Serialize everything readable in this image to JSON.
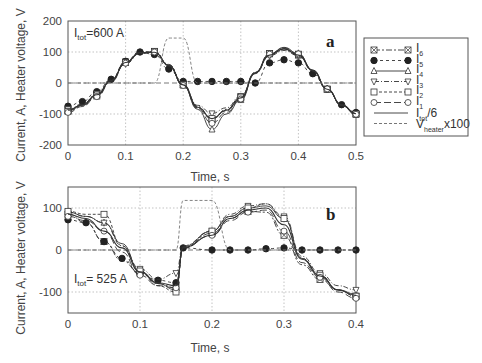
{
  "chart_data": [
    {
      "type": "line",
      "panel_label": "a",
      "annotation": "I_tot=600 A",
      "xlabel": "Time, s",
      "ylabel": "Current, A, Heater voltage, V",
      "xlim": [
        0,
        0.5
      ],
      "ylim": [
        -200,
        200
      ],
      "x_ticks": [
        "0",
        "0.1",
        "0.2",
        "0.3",
        "0.4",
        "0.5"
      ],
      "y_ticks": [
        "200",
        "100",
        "0",
        "-100",
        "-200"
      ],
      "grid": true,
      "x": [
        0,
        0.025,
        0.05,
        0.075,
        0.1,
        0.125,
        0.15,
        0.175,
        0.2,
        0.225,
        0.25,
        0.275,
        0.3,
        0.325,
        0.35,
        0.375,
        0.4,
        0.425,
        0.45,
        0.475,
        0.5
      ],
      "series": [
        {
          "name": "I6",
          "marker": "boxed-x",
          "values": [
            -88,
            -70,
            -38,
            10,
            68,
            100,
            102,
            60,
            -5,
            -75,
            -118,
            -85,
            -45,
            35,
            95,
            110,
            90,
            40,
            -20,
            -70,
            -100
          ]
        },
        {
          "name": "I5",
          "marker": "filled-circle",
          "values": [
            -75,
            -60,
            -28,
            12,
            70,
            100,
            92,
            45,
            5,
            5,
            5,
            5,
            5,
            0,
            65,
            75,
            65,
            30,
            -20,
            -70,
            -95
          ]
        },
        {
          "name": "I4",
          "marker": "triangle-up",
          "values": [
            -90,
            -72,
            -40,
            8,
            66,
            98,
            100,
            58,
            -8,
            -85,
            -150,
            -100,
            -55,
            32,
            92,
            115,
            95,
            42,
            -18,
            -72,
            -102
          ]
        },
        {
          "name": "I3",
          "marker": "triangle-down",
          "values": [
            -85,
            -68,
            -35,
            10,
            62,
            95,
            98,
            55,
            -5,
            -72,
            -98,
            -80,
            -42,
            30,
            88,
            105,
            88,
            38,
            -20,
            -70,
            -98
          ]
        },
        {
          "name": "I2",
          "marker": "square",
          "values": [
            -92,
            -74,
            -42,
            6,
            66,
            98,
            102,
            58,
            -6,
            -80,
            -115,
            -90,
            -48,
            34,
            95,
            112,
            93,
            40,
            -20,
            -72,
            -100
          ]
        },
        {
          "name": "I1",
          "marker": "circle",
          "values": [
            -95,
            -76,
            -44,
            4,
            64,
            96,
            100,
            56,
            -8,
            -82,
            -130,
            -95,
            -52,
            33,
            93,
            113,
            94,
            41,
            -19,
            -73,
            -101
          ]
        },
        {
          "name": "Itot/6",
          "marker": "none",
          "style": "solid",
          "values": [
            -88,
            -70,
            -38,
            8,
            66,
            98,
            99,
            56,
            -6,
            -78,
            -115,
            -88,
            -48,
            32,
            90,
            110,
            90,
            40,
            -20,
            -70,
            -99
          ]
        },
        {
          "name": "Vheater x100",
          "marker": "none",
          "style": "dashed",
          "values": [
            0,
            0,
            0,
            0,
            0,
            0,
            0,
            145,
            145,
            0,
            0,
            0,
            0,
            0,
            0,
            0,
            0,
            0,
            0,
            0,
            0
          ]
        }
      ]
    },
    {
      "type": "line",
      "panel_label": "b",
      "annotation": "I_tot= 525 A",
      "xlabel": "Time, s",
      "ylabel": "Current, A, Heater voltage, V",
      "xlim": [
        0,
        0.4
      ],
      "ylim": [
        -150,
        150
      ],
      "x_ticks": [
        "0",
        "0.1",
        "0.2",
        "0.3",
        "0.4"
      ],
      "y_ticks": [
        "100",
        "0",
        "-100"
      ],
      "grid": true,
      "x": [
        0,
        0.025,
        0.05,
        0.075,
        0.1,
        0.125,
        0.15,
        0.16,
        0.2,
        0.225,
        0.25,
        0.275,
        0.3,
        0.325,
        0.35,
        0.375,
        0.4
      ],
      "series": [
        {
          "name": "I6",
          "marker": "boxed-x",
          "values": [
            85,
            65,
            20,
            -25,
            -55,
            -80,
            -90,
            5,
            40,
            75,
            92,
            90,
            35,
            -35,
            -70,
            -95,
            -110
          ]
        },
        {
          "name": "I5",
          "marker": "filled-circle",
          "values": [
            72,
            65,
            20,
            -20,
            -55,
            -72,
            -78,
            5,
            0,
            0,
            0,
            3,
            5,
            0,
            0,
            0,
            0
          ]
        },
        {
          "name": "I4",
          "marker": "triangle-up",
          "values": [
            90,
            80,
            65,
            15,
            -50,
            -80,
            -95,
            8,
            45,
            80,
            100,
            105,
            75,
            -20,
            -60,
            -95,
            -105
          ]
        },
        {
          "name": "I3",
          "marker": "triangle-down",
          "values": [
            90,
            80,
            65,
            10,
            -45,
            -70,
            -55,
            10,
            45,
            85,
            105,
            110,
            80,
            -15,
            -55,
            -85,
            -95
          ]
        },
        {
          "name": "I2",
          "marker": "square",
          "values": [
            92,
            85,
            85,
            10,
            -50,
            -85,
            -100,
            5,
            45,
            80,
            100,
            110,
            75,
            -20,
            -60,
            -95,
            -110
          ]
        },
        {
          "name": "I1",
          "marker": "circle",
          "values": [
            80,
            70,
            45,
            -5,
            -60,
            -85,
            -90,
            5,
            35,
            70,
            90,
            95,
            45,
            -30,
            -65,
            -100,
            -115
          ]
        },
        {
          "name": "Itot/6",
          "marker": "none",
          "style": "solid",
          "values": [
            85,
            75,
            45,
            5,
            -52,
            -78,
            -85,
            6,
            35,
            75,
            95,
            100,
            60,
            -22,
            -62,
            -95,
            -108
          ]
        },
        {
          "name": "Vheater x100",
          "marker": "none",
          "style": "dashed",
          "values": [
            0,
            0,
            0,
            0,
            0,
            0,
            0,
            118,
            118,
            0,
            0,
            0,
            0,
            0,
            0,
            0,
            0
          ]
        }
      ]
    }
  ],
  "legend": {
    "entries": [
      {
        "label": "I",
        "sub": "6"
      },
      {
        "label": "I",
        "sub": "5"
      },
      {
        "label": "I",
        "sub": "4"
      },
      {
        "label": "I",
        "sub": "3"
      },
      {
        "label": "I",
        "sub": "2"
      },
      {
        "label": "I",
        "sub": "1"
      },
      {
        "label": "I",
        "sub": "tot",
        "suffix": "/6"
      },
      {
        "label": "V",
        "sub": "heater",
        "suffix": "x100"
      }
    ]
  },
  "labels": {
    "a_panel": "a",
    "b_panel": "b",
    "a_annot_main": "I",
    "a_annot_sub": "tot",
    "a_annot_rest": "=600 A",
    "b_annot_main": "I",
    "b_annot_sub": "tot",
    "b_annot_rest": "= 525 A",
    "xlabel": "Time, s",
    "ylabel": "Current, A, Heater voltage, V"
  }
}
